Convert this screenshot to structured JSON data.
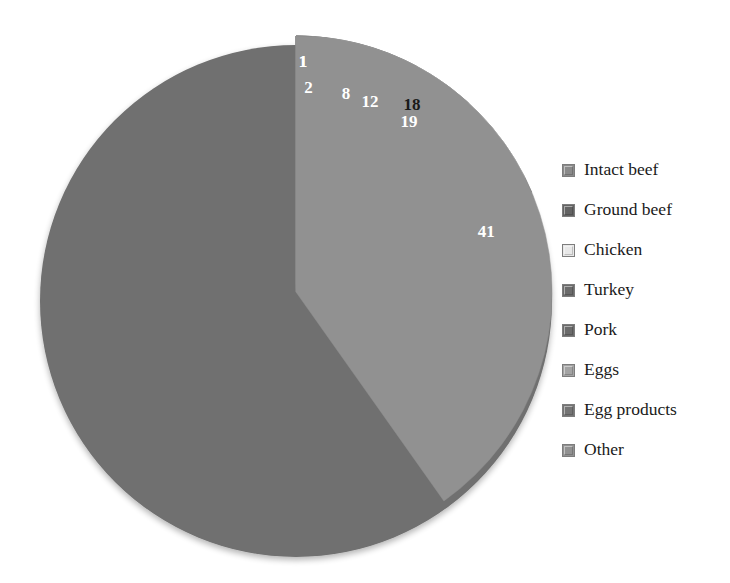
{
  "chart_data": {
    "type": "pie",
    "title": "",
    "subtitle": "",
    "xlabel": "",
    "ylabel": "",
    "grid": false,
    "legend_position": "right",
    "units": "percent",
    "total": 102,
    "start_angle_deg": 0,
    "direction": "clockwise",
    "categories": [
      "Intact beef",
      "Ground beef",
      "Chicken",
      "Turkey",
      "Pork",
      "Eggs",
      "Egg products",
      "Other"
    ],
    "values": [
      1,
      19,
      18,
      8,
      2,
      12,
      1,
      41
    ],
    "data_labels": [
      "1",
      "19",
      "18",
      "8",
      "2",
      "12",
      "1",
      "41"
    ],
    "slices": [
      {
        "label": "Intact beef",
        "value": 1,
        "data_label": "1",
        "color": "#8a8a8a",
        "label_color": "#ffffff"
      },
      {
        "label": "Ground beef",
        "value": 19,
        "data_label": "19",
        "color": "#636363",
        "label_color": "#ffffff"
      },
      {
        "label": "Chicken",
        "value": 18,
        "data_label": "18",
        "color": "#e8e8e8",
        "label_color": "#1a1a1a"
      },
      {
        "label": "Turkey",
        "value": 8,
        "data_label": "8",
        "color": "#6b6b6b",
        "label_color": "#ffffff"
      },
      {
        "label": "Pork",
        "value": 2,
        "data_label": "2",
        "color": "#6b6b6b",
        "label_color": "#ffffff"
      },
      {
        "label": "Eggs",
        "value": 12,
        "data_label": "12",
        "color": "#a3a3a3",
        "label_color": "#ffffff"
      },
      {
        "label": "Egg products",
        "value": 1,
        "data_label": "1",
        "color": "#747474",
        "label_color": "#ffffff"
      },
      {
        "label": "Other",
        "value": 41,
        "data_label": "41",
        "color": "#919191",
        "label_color": "#ffffff"
      }
    ]
  },
  "legend": {
    "items": [
      {
        "label": "Intact beef",
        "color": "#8a8a8a"
      },
      {
        "label": "Ground beef",
        "color": "#636363"
      },
      {
        "label": "Chicken",
        "color": "#e8e8e8"
      },
      {
        "label": "Turkey",
        "color": "#6b6b6b"
      },
      {
        "label": "Pork",
        "color": "#6b6b6b"
      },
      {
        "label": "Eggs",
        "color": "#a3a3a3"
      },
      {
        "label": "Egg products",
        "color": "#747474"
      },
      {
        "label": "Other",
        "color": "#919191"
      }
    ]
  },
  "geometry": {
    "center_x": 296,
    "center_y": 292,
    "radius": 256,
    "rim_depth": 9
  },
  "colors": {
    "background": "#ffffff",
    "edge": "#7d7d7d",
    "rim_shadow": "#6f6f6f"
  }
}
